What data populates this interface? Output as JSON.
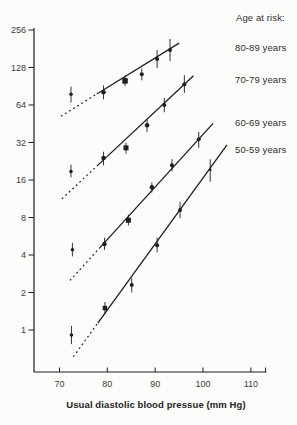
{
  "figure": {
    "legend_title": "Age at risk:",
    "background": "#fcfcfa",
    "ink": "#1e1e1e",
    "text_color": "#2f2f2f"
  },
  "chart_data": {
    "type": "scatter",
    "title": "",
    "xlabel": "Usual diastolic blood pressue (mm Hg)",
    "ylabel": "",
    "legend_title": "Age at risk:",
    "x_ticks": [
      70,
      80,
      90,
      100,
      110
    ],
    "y_ticks": [
      256,
      128,
      64,
      32,
      16,
      8,
      4,
      2,
      1
    ],
    "y_scale": "log2",
    "xlim": [
      65,
      113
    ],
    "ylim": [
      0.5,
      300
    ],
    "grid": false,
    "legend_position": "right",
    "series": [
      {
        "name": "80-89 years",
        "points": [
          {
            "dbp": 72.4,
            "value": 78,
            "ci": [
              67,
              90
            ],
            "marker": "circle",
            "size": 3.5,
            "isolated": true
          },
          {
            "dbp": 79.2,
            "value": 81,
            "ci": [
              71,
              92
            ],
            "marker": "circle",
            "size": 4.5
          },
          {
            "dbp": 83.7,
            "value": 100,
            "ci": [
              91,
              110
            ],
            "marker": "square",
            "size": 5.5
          },
          {
            "dbp": 87.2,
            "value": 113,
            "ci": [
              101,
              126
            ],
            "marker": "circle",
            "size": 4
          },
          {
            "dbp": 90.4,
            "value": 150,
            "ci": [
              127,
              177
            ],
            "marker": "circle",
            "size": 4
          },
          {
            "dbp": 93.1,
            "value": 177,
            "ci": [
              144,
              217
            ],
            "marker": "circle",
            "size": 4
          }
        ],
        "trend_line": {
          "x1": 70.3,
          "v1": 52,
          "x2": 95.0,
          "v2": 201,
          "dash_until": 77.8
        }
      },
      {
        "name": "70-79 years",
        "points": [
          {
            "dbp": 72.4,
            "value": 18.7,
            "ci": [
              16.8,
              21.2
            ],
            "marker": "circle",
            "size": 3.5,
            "isolated": true
          },
          {
            "dbp": 79.2,
            "value": 24,
            "ci": [
              21,
              27
            ],
            "marker": "circle",
            "size": 4.5
          },
          {
            "dbp": 83.9,
            "value": 29,
            "ci": [
              26,
              32
            ],
            "marker": "square",
            "size": 5
          },
          {
            "dbp": 88.3,
            "value": 44,
            "ci": [
              39,
              49
            ],
            "marker": "circle",
            "size": 4.5
          },
          {
            "dbp": 91.9,
            "value": 64,
            "ci": [
              56,
              73
            ],
            "marker": "circle",
            "size": 4
          },
          {
            "dbp": 96.1,
            "value": 94,
            "ci": [
              80,
              111
            ],
            "marker": "circle",
            "size": 4
          }
        ],
        "trend_line": {
          "x1": 70.5,
          "v1": 11.3,
          "x2": 98.0,
          "v2": 110,
          "dash_until": 77.8
        }
      },
      {
        "name": "60-69 years",
        "points": [
          {
            "dbp": 72.7,
            "value": 4.4,
            "ci": [
              3.9,
              5.0
            ],
            "marker": "circle",
            "size": 3.5,
            "isolated": true
          },
          {
            "dbp": 79.4,
            "value": 4.9,
            "ci": [
              4.4,
              5.5
            ],
            "marker": "circle",
            "size": 4.5
          },
          {
            "dbp": 84.4,
            "value": 7.6,
            "ci": [
              6.9,
              8.4
            ],
            "marker": "square",
            "size": 5
          },
          {
            "dbp": 89.3,
            "value": 14,
            "ci": [
              12.7,
              15.3
            ],
            "marker": "circle",
            "size": 4.5
          },
          {
            "dbp": 93.5,
            "value": 21,
            "ci": [
              18.8,
              23.5
            ],
            "marker": "circle",
            "size": 4
          },
          {
            "dbp": 99.1,
            "value": 34,
            "ci": [
              29,
              39
            ],
            "marker": "circle",
            "size": 4
          }
        ],
        "trend_line": {
          "x1": 72.2,
          "v1": 2.5,
          "x2": 102.1,
          "v2": 45.6,
          "dash_until": 78.4
        }
      },
      {
        "name": "50-59 years",
        "points": [
          {
            "dbp": 72.5,
            "value": 0.91,
            "ci": [
              0.77,
              1.08
            ],
            "marker": "circle",
            "size": 3.5,
            "isolated": true
          },
          {
            "dbp": 79.5,
            "value": 1.5,
            "ci": [
              1.34,
              1.68
            ],
            "marker": "square",
            "size": 4.5
          },
          {
            "dbp": 85.1,
            "value": 2.3,
            "ci": [
              2.0,
              2.6
            ],
            "marker": "circle",
            "size": 4
          },
          {
            "dbp": 90.4,
            "value": 4.8,
            "ci": [
              4.2,
              5.5
            ],
            "marker": "circle",
            "size": 4
          },
          {
            "dbp": 95.2,
            "value": 9.2,
            "ci": [
              7.9,
              10.7
            ],
            "marker": "circle",
            "size": 4
          },
          {
            "dbp": 101.5,
            "value": 19.3,
            "ci": [
              15.5,
              23.5
            ],
            "marker": "circle",
            "size": 2.5
          }
        ],
        "trend_line": {
          "x1": 72.9,
          "v1": 0.61,
          "x2": 105.0,
          "v2": 30.6,
          "dash_until": 78.0
        }
      }
    ]
  }
}
